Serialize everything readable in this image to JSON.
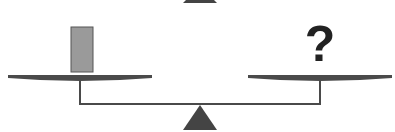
{
  "diagram": {
    "type": "balance-scale",
    "left_pan": {
      "item": "rectangular-block",
      "item_color": "#9a9a9a",
      "item_border": "#555555"
    },
    "right_pan": {
      "item": "unknown",
      "label": "?"
    },
    "colors": {
      "pan": "#4a4a4a",
      "beam": "#4a4a4a",
      "fulcrum": "#444444",
      "question_mark": "#222222",
      "background": "#ffffff"
    },
    "state": "balanced"
  }
}
